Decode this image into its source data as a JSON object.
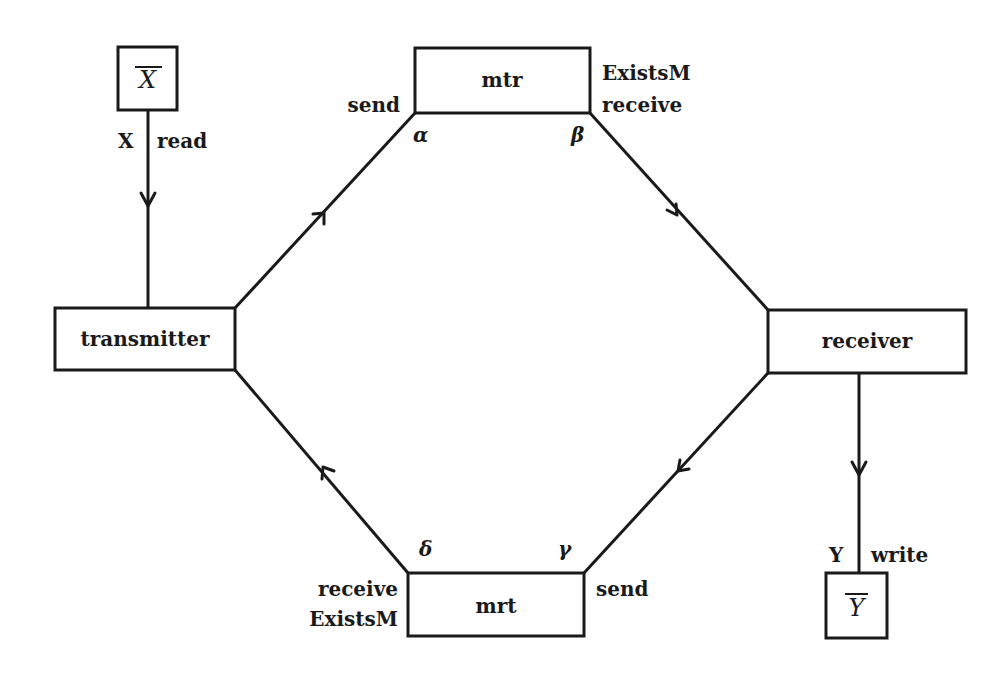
{
  "diagram": {
    "nodes": {
      "xbar": {
        "label": "X",
        "overbar": true,
        "x": 118,
        "y": 47,
        "w": 59,
        "h": 63
      },
      "transmitter": {
        "label": "transmitter",
        "x": 55,
        "y": 308,
        "w": 180,
        "h": 62
      },
      "mtr": {
        "label": "mtr",
        "x": 415,
        "y": 48,
        "w": 175,
        "h": 65
      },
      "receiver": {
        "label": "receiver",
        "x": 768,
        "y": 310,
        "w": 198,
        "h": 63
      },
      "mrt": {
        "label": "mrt",
        "x": 408,
        "y": 573,
        "w": 176,
        "h": 63
      },
      "ybar": {
        "label": "Y",
        "overbar": true,
        "x": 826,
        "y": 573,
        "w": 61,
        "h": 65
      }
    },
    "edges": [
      {
        "from": "xbar",
        "to": "transmitter",
        "left_label": "X",
        "right_label": "read"
      },
      {
        "from": "transmitter",
        "to": "mtr",
        "port_label": "send",
        "corner": "α"
      },
      {
        "from": "mtr",
        "to": "receiver",
        "port_label_top": "ExistsM",
        "port_label_bottom": "receive",
        "corner": "β"
      },
      {
        "from": "receiver",
        "to": "mrt",
        "port_label": "send",
        "corner": "γ"
      },
      {
        "from": "mrt",
        "to": "transmitter",
        "port_label_top": "receive",
        "port_label_bottom": "ExistsM",
        "corner": "δ"
      },
      {
        "from": "receiver",
        "to": "ybar",
        "left_label": "Y",
        "right_label": "write"
      }
    ],
    "labels": {
      "x_read_left": "X",
      "x_read_right": "read",
      "mtr_send": "send",
      "mtr_existsm": "ExistsM",
      "mtr_receive": "receive",
      "alpha": "α",
      "beta": "β",
      "gamma": "γ",
      "delta": "δ",
      "mrt_receive": "receive",
      "mrt_existsm": "ExistsM",
      "mrt_send": "send",
      "y_write_left": "Y",
      "y_write_right": "write"
    }
  }
}
